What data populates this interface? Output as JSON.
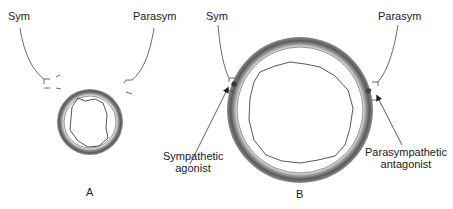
{
  "panel_a": {
    "letter": "A",
    "sym_label": "Sym",
    "parasym_label": "Parasym"
  },
  "panel_b": {
    "letter": "B",
    "sym_label": "Sym",
    "parasym_label": "Parasym",
    "sympathetic_agonist": [
      "Sympathetic",
      "agonist"
    ],
    "parasympathetic_antagonist": [
      "Parasympathetic",
      "antagonist"
    ]
  },
  "colors": {
    "stroke": "#333333",
    "ring_dark": "#555555",
    "ring_light": "#bbbbbb"
  }
}
